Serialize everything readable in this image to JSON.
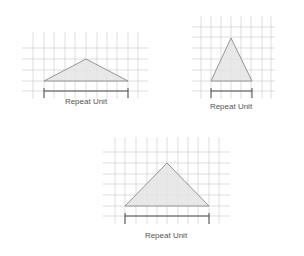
{
  "figures": [
    {
      "id": "wide-low-triangle",
      "label": "Repeat Unit",
      "grid": {
        "x_lines": [
          33,
          44,
          54,
          65,
          75,
          86,
          97,
          107,
          117,
          128,
          138
        ],
        "y_lines": [
          48,
          59,
          70,
          81,
          91
        ],
        "v_span": [
          32,
          99
        ],
        "h_span": [
          22,
          148
        ]
      },
      "triangle": [
        [
          44,
          81
        ],
        [
          86,
          59
        ],
        [
          128,
          81
        ]
      ],
      "bracket": {
        "x1": 44,
        "x2": 128,
        "y": 91,
        "tick_top": 88,
        "tick_bottom": 98
      },
      "label_pos": [
        86,
        104
      ]
    },
    {
      "id": "tall-narrow-triangle",
      "label": "Repeat Unit",
      "grid": {
        "x_lines": [
          201,
          211,
          221,
          231,
          241,
          251,
          262,
          271
        ],
        "y_lines": [
          27,
          37,
          48,
          59,
          70,
          81,
          91
        ],
        "v_span": [
          16,
          99
        ],
        "h_span": [
          192,
          275
        ]
      },
      "triangle": [
        [
          211,
          81
        ],
        [
          231,
          38
        ],
        [
          252,
          81
        ]
      ],
      "bracket": {
        "x1": 211,
        "x2": 252,
        "y": 91,
        "tick_top": 88,
        "tick_bottom": 98
      },
      "label_pos": [
        231,
        109
      ]
    },
    {
      "id": "large-triangle",
      "label": "Repeat Unit",
      "grid": {
        "x_lines": [
          115,
          125,
          136,
          147,
          157,
          167,
          178,
          188,
          198,
          209,
          219
        ],
        "y_lines": [
          152,
          163,
          174,
          184,
          195,
          206,
          216
        ],
        "v_span": [
          137,
          224
        ],
        "h_span": [
          103,
          230
        ]
      },
      "triangle": [
        [
          125,
          206
        ],
        [
          167,
          163
        ],
        [
          209,
          206
        ]
      ],
      "bracket": {
        "x1": 125,
        "x2": 209,
        "y": 216,
        "tick_top": 213,
        "tick_bottom": 224
      },
      "label_pos": [
        166,
        238
      ]
    }
  ],
  "colors": {
    "grid": "#cfcfcf",
    "fill": "#e4e4e4",
    "edge": "#8a8a8a",
    "bracket": "#4a4a4a",
    "text": "#555555"
  }
}
